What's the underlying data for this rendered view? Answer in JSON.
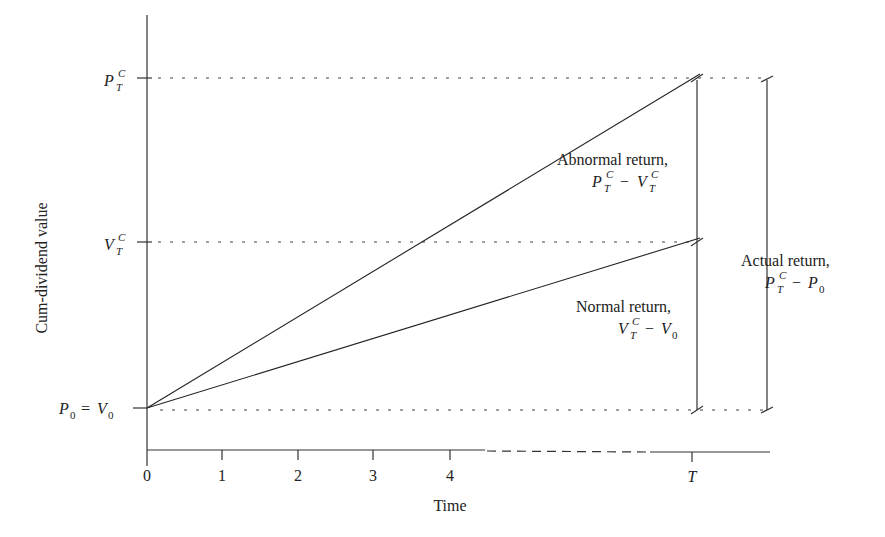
{
  "diagram": {
    "title": "",
    "y_axis_label": "Cum-dividend value",
    "x_axis_label": "Time",
    "x_ticks": [
      "0",
      "1",
      "2",
      "3",
      "4",
      "T"
    ],
    "y_levels": {
      "top": {
        "base": "P",
        "sup": "C",
        "sub": "T"
      },
      "middle": {
        "base": "V",
        "sup": "C",
        "sub": "T"
      },
      "bottom": {
        "lhs_base": "P",
        "lhs_sub": "0",
        "eq": "=",
        "rhs_base": "V",
        "rhs_sub": "0"
      }
    },
    "annotations": {
      "abnormal": {
        "label": "Abnormal return,",
        "formula": {
          "a_base": "P",
          "a_sup": "C",
          "a_sub": "T",
          "op": "−",
          "b_base": "V",
          "b_sup": "C",
          "b_sub": "T"
        }
      },
      "normal": {
        "label": "Normal return,",
        "formula": {
          "a_base": "V",
          "a_sup": "C",
          "a_sub": "T",
          "op": "−",
          "b_base": "V",
          "b_sub": "0"
        }
      },
      "actual": {
        "label": "Actual return,",
        "formula": {
          "a_base": "P",
          "a_sup": "C",
          "a_sub": "T",
          "op": "−",
          "b_base": "P",
          "b_sub": "0"
        }
      }
    },
    "lines": [
      {
        "name": "actual-price-path",
        "from": "P0 at t=0",
        "to": "P_T^C at T"
      },
      {
        "name": "normal-value-path",
        "from": "V0 at t=0",
        "to": "V_T^C at T"
      }
    ]
  }
}
